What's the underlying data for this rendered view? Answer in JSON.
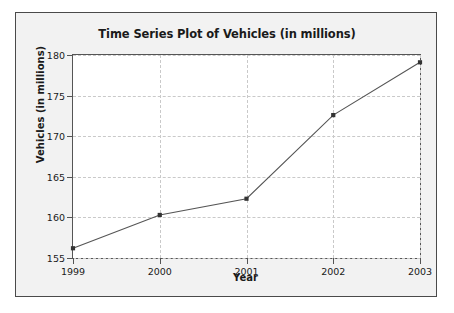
{
  "chart_data": {
    "type": "line",
    "title": "Time Series Plot of Vehicles (in millions)",
    "xlabel": "Year",
    "ylabel": "Vehicles (in millions)",
    "categories": [
      "1999",
      "2000",
      "2001",
      "2002",
      "2003"
    ],
    "x": [
      1999,
      2000,
      2001,
      2002,
      2003
    ],
    "values": [
      156.2,
      160.3,
      162.3,
      172.6,
      179.1
    ],
    "series": [
      {
        "name": "Vehicles",
        "values": [
          156.2,
          160.3,
          162.3,
          172.6,
          179.1
        ]
      }
    ],
    "xlim": [
      1999,
      2003
    ],
    "ylim": [
      155,
      180
    ],
    "yticks": [
      155,
      160,
      165,
      170,
      175,
      180
    ],
    "ytick_labels": [
      "155",
      "160",
      "165",
      "170",
      "175",
      "180"
    ],
    "xticks": [
      1999,
      2000,
      2001,
      2002,
      2003
    ],
    "xtick_labels": [
      "1999",
      "2000",
      "2001",
      "2002",
      "2003"
    ],
    "grid": true,
    "grid_style": "dashed",
    "legend": false,
    "legend_position": "none",
    "marker": "square",
    "line_color": "#555555",
    "marker_color": "#333333",
    "grid_color": "#c9c9c9",
    "plot_background": "#ffffff",
    "figure_background": "#f2f2f2",
    "axis_color": "#555555",
    "text_color": "#1a1a1a"
  }
}
